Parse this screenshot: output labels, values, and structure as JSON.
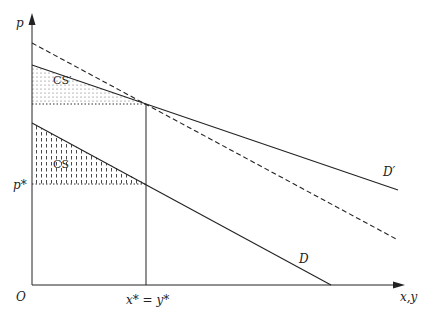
{
  "diagram": {
    "type": "consumer-surplus-demand-shift",
    "axes": {
      "y_label": "p",
      "x_label": "x,y",
      "origin_label": "O"
    },
    "labels": {
      "p_star": "p*",
      "x_star": "x* = y*",
      "demand": "D",
      "demand_shifted": "D′",
      "cs": "CS",
      "cs_shifted": "CS′"
    },
    "lines": [
      {
        "name": "D",
        "style": "solid",
        "from": [
          32,
          123
        ],
        "to": [
          331,
          285
        ]
      },
      {
        "name": "D′",
        "style": "solid",
        "from": [
          32,
          65
        ],
        "to": [
          398,
          190
        ]
      },
      {
        "name": "dashed",
        "style": "dashed",
        "from": [
          32,
          43
        ],
        "to": [
          398,
          240
        ]
      }
    ],
    "colors": {
      "ink": "#222222",
      "background": "#ffffff"
    }
  }
}
